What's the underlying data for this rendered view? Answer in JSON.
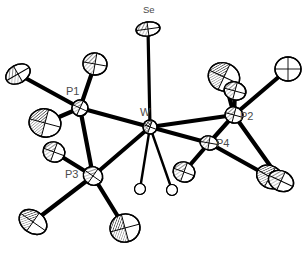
{
  "figure": {
    "type": "ortep-molecular-structure",
    "title": "",
    "caption": "",
    "background_color": "#ffffff",
    "bond_color": "#000000",
    "label_color": "#4a4a4a",
    "ellipsoid_fill": "#ffffff",
    "ellipsoid_stroke": "#000000",
    "hydride_fill": "#ffffff"
  },
  "labels": [
    {
      "id": "label-se",
      "text": "Se",
      "x": 143,
      "y": 13,
      "size": 9.5
    },
    {
      "id": "label-w",
      "text": "W",
      "x": 140,
      "y": 116,
      "size": 11
    },
    {
      "id": "label-p1",
      "text": "P1",
      "x": 66,
      "y": 95,
      "size": 11
    },
    {
      "id": "label-p2",
      "text": "P2",
      "x": 240,
      "y": 120,
      "size": 11
    },
    {
      "id": "label-p3",
      "text": "P3",
      "x": 65,
      "y": 178,
      "size": 11
    },
    {
      "id": "label-p4",
      "text": "P4",
      "x": 216,
      "y": 147,
      "size": 11
    }
  ],
  "atoms": [
    {
      "id": "W",
      "element": "W",
      "kind": "metal",
      "x": 150,
      "y": 127,
      "rx": 7,
      "ry": 7,
      "rot": 20,
      "hatch": "cross"
    },
    {
      "id": "Se",
      "element": "Se",
      "kind": "chalcogen",
      "x": 148,
      "y": 29,
      "rx": 12,
      "ry": 7,
      "rot": -8,
      "hatch": "fine"
    },
    {
      "id": "P1",
      "element": "P",
      "kind": "phosphorus",
      "x": 80,
      "y": 108,
      "rx": 8,
      "ry": 8,
      "rot": 25,
      "hatch": "fine"
    },
    {
      "id": "P2",
      "element": "P",
      "kind": "phosphorus",
      "x": 234,
      "y": 115,
      "rx": 9,
      "ry": 8,
      "rot": 15,
      "hatch": "fine"
    },
    {
      "id": "P3",
      "element": "P",
      "kind": "phosphorus",
      "x": 93,
      "y": 176,
      "rx": 10,
      "ry": 9,
      "rot": 35,
      "hatch": "fine"
    },
    {
      "id": "P4",
      "element": "P",
      "kind": "phosphorus",
      "x": 209,
      "y": 143,
      "rx": 9,
      "ry": 7,
      "rot": 10,
      "hatch": "fine"
    },
    {
      "id": "C1",
      "element": "C",
      "kind": "carbon",
      "x": 18,
      "y": 74,
      "rx": 13,
      "ry": 9,
      "rot": -30,
      "hatch": "fine"
    },
    {
      "id": "C2",
      "element": "C",
      "kind": "carbon",
      "x": 95,
      "y": 64,
      "rx": 12,
      "ry": 11,
      "rot": 10,
      "hatch": "fine"
    },
    {
      "id": "C3",
      "element": "C",
      "kind": "carbon",
      "x": 45,
      "y": 123,
      "rx": 16,
      "ry": 14,
      "rot": 15,
      "hatch": "dense"
    },
    {
      "id": "C4",
      "element": "C",
      "kind": "carbon",
      "x": 54,
      "y": 152,
      "rx": 11,
      "ry": 10,
      "rot": 20,
      "hatch": "fine"
    },
    {
      "id": "C5",
      "element": "C",
      "kind": "carbon",
      "x": 33,
      "y": 222,
      "rx": 15,
      "ry": 11,
      "rot": 35,
      "hatch": "dense"
    },
    {
      "id": "C6",
      "element": "C",
      "kind": "carbon",
      "x": 125,
      "y": 228,
      "rx": 15,
      "ry": 14,
      "rot": -15,
      "hatch": "dense"
    },
    {
      "id": "C7",
      "element": "C",
      "kind": "carbon",
      "x": 224,
      "y": 77,
      "rx": 16,
      "ry": 14,
      "rot": 25,
      "hatch": "dense"
    },
    {
      "id": "C8",
      "element": "C",
      "kind": "carbon",
      "x": 235,
      "y": 91,
      "rx": 11,
      "ry": 9,
      "rot": 15,
      "hatch": "fine"
    },
    {
      "id": "C9",
      "element": "C",
      "kind": "carbon",
      "x": 288,
      "y": 69,
      "rx": 13,
      "ry": 12,
      "rot": 0,
      "hatch": "open"
    },
    {
      "id": "C10",
      "element": "C",
      "kind": "carbon",
      "x": 270,
      "y": 177,
      "rx": 14,
      "ry": 11,
      "rot": 30,
      "hatch": "dense"
    },
    {
      "id": "C11",
      "element": "C",
      "kind": "carbon",
      "x": 281,
      "y": 181,
      "rx": 13,
      "ry": 10,
      "rot": 25,
      "hatch": "fine"
    },
    {
      "id": "C12",
      "element": "C",
      "kind": "carbon",
      "x": 184,
      "y": 172,
      "rx": 11,
      "ry": 10,
      "rot": 20,
      "hatch": "fine"
    },
    {
      "id": "H1",
      "element": "H",
      "kind": "hydride",
      "x": 140,
      "y": 189,
      "rx": 5.5,
      "ry": 5.5,
      "rot": 0,
      "hatch": "none"
    },
    {
      "id": "H2",
      "element": "H",
      "kind": "hydride",
      "x": 172,
      "y": 190,
      "rx": 5.5,
      "ry": 5.5,
      "rot": 0,
      "hatch": "none"
    }
  ],
  "bonds": [
    {
      "id": "bond-w-se",
      "from": "W",
      "to": "Se",
      "width": 3.2
    },
    {
      "id": "bond-w-p1",
      "from": "W",
      "to": "P1",
      "width": 4.0
    },
    {
      "id": "bond-w-p2",
      "from": "W",
      "to": "P2",
      "width": 4.0
    },
    {
      "id": "bond-w-p3",
      "from": "W",
      "to": "P3",
      "width": 4.0
    },
    {
      "id": "bond-w-p4",
      "from": "W",
      "to": "P4",
      "width": 4.0
    },
    {
      "id": "bond-w-h1",
      "from": "W",
      "to": "H1",
      "width": 2.4
    },
    {
      "id": "bond-w-h2",
      "from": "W",
      "to": "H2",
      "width": 2.4
    },
    {
      "id": "bond-p1-c1",
      "from": "P1",
      "to": "C1",
      "width": 4.2
    },
    {
      "id": "bond-p1-c2",
      "from": "P1",
      "to": "C2",
      "width": 4.2
    },
    {
      "id": "bond-p1-c3",
      "from": "P1",
      "to": "C3",
      "width": 4.2
    },
    {
      "id": "bond-p1-p3",
      "from": "P1",
      "to": "P3",
      "width": 4.2
    },
    {
      "id": "bond-p3-c4",
      "from": "P3",
      "to": "C4",
      "width": 4.2
    },
    {
      "id": "bond-p3-c5",
      "from": "P3",
      "to": "C5",
      "width": 4.2
    },
    {
      "id": "bond-p3-c6",
      "from": "P3",
      "to": "C6",
      "width": 4.2
    },
    {
      "id": "bond-p2-c7",
      "from": "P2",
      "to": "C7",
      "width": 4.2
    },
    {
      "id": "bond-p2-c8",
      "from": "P2",
      "to": "C8",
      "width": 4.2
    },
    {
      "id": "bond-p2-c9",
      "from": "P2",
      "to": "C9",
      "width": 4.2
    },
    {
      "id": "bond-p2-c11",
      "from": "P2",
      "to": "C11",
      "width": 4.2
    },
    {
      "id": "bond-p2-p4",
      "from": "P2",
      "to": "P4",
      "width": 4.2
    },
    {
      "id": "bond-p4-c10",
      "from": "P4",
      "to": "C10",
      "width": 4.2
    },
    {
      "id": "bond-p4-c12",
      "from": "P4",
      "to": "C12",
      "width": 4.2
    }
  ]
}
